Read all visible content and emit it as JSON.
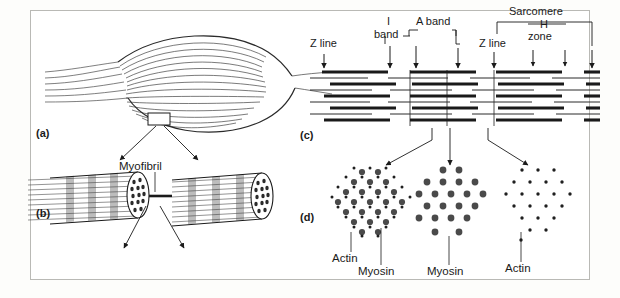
{
  "figure": {
    "background": "#ffffff",
    "border_color": "#b9b9b5",
    "ink_color": "#1a1a1a",
    "band_color": "#9a9a9a"
  },
  "panels": [
    {
      "id": "a",
      "letter": "(a)",
      "name": "whole-muscle",
      "description": "whole muscle belly with tendons"
    },
    {
      "id": "b",
      "letter": "(b)",
      "name": "myofibril",
      "description": "two banded myofibril cylinders"
    },
    {
      "id": "c",
      "letter": "(c)",
      "name": "sarcomere-bands",
      "description": "longitudinal thick and thin filament array"
    },
    {
      "id": "d",
      "letter": "(d)",
      "name": "filament-cross-sections",
      "description": "three transverse sections through filaments"
    }
  ],
  "callouts": {
    "myofibril": "Myofibril"
  },
  "sarcomere_labels": [
    {
      "key": "z_line_left",
      "text": "Z line",
      "x": 321,
      "y": 44,
      "arrow_x": 324,
      "arrow_top": 54,
      "arrow_bottom": 68
    },
    {
      "key": "i_band",
      "text": "I",
      "x": 393,
      "y": 22,
      "arrow_x": 390,
      "arrow_top": 46,
      "arrow_bottom": 68
    },
    {
      "key": "i_band_2",
      "text": "band",
      "x": 383,
      "y": 35,
      "arrow_x": 390,
      "arrow_top": 46,
      "arrow_bottom": 68
    },
    {
      "key": "a_band",
      "text": "A band",
      "x": 423,
      "y": 22,
      "arrow_x": 416,
      "arrow_top": 46,
      "arrow_bottom": 68
    },
    {
      "key": "z_line_right",
      "text": "Z line",
      "x": 492,
      "y": 44,
      "arrow_x": 494,
      "arrow_top": 54,
      "arrow_bottom": 68
    },
    {
      "key": "sarcomere",
      "text": "Sarcomere",
      "x": 515,
      "y": 12,
      "arrow_x": 592,
      "arrow_top": 46,
      "arrow_bottom": 68
    },
    {
      "key": "h_zone",
      "text": "H",
      "x": 545,
      "y": 25,
      "arrow_x": 533,
      "arrow_top": 50,
      "arrow_bottom": 66
    },
    {
      "key": "h_zone_2",
      "text": "zone",
      "x": 535,
      "y": 37,
      "arrow_x": 565,
      "arrow_top": 50,
      "arrow_bottom": 66
    }
  ],
  "cross_sections": [
    {
      "key": "overlap",
      "name": "overlap-region",
      "labels": [
        "Actin",
        "Myosin"
      ]
    },
    {
      "key": "a_band_center",
      "name": "myosin-only-region",
      "labels": [
        "Myosin"
      ]
    },
    {
      "key": "i_band_region",
      "name": "actin-only-region",
      "labels": [
        "Actin"
      ]
    }
  ],
  "cross_section_labels": [
    {
      "key": "actin_left",
      "text": "Actin",
      "x": 341,
      "y": 258,
      "leader_x": 351,
      "leader_top": 232,
      "leader_bottom": 252
    },
    {
      "key": "myosin_left",
      "text": "Myosin",
      "x": 366,
      "y": 271,
      "leader_x": 381,
      "leader_top": 228,
      "leader_bottom": 265
    },
    {
      "key": "myosin_mid",
      "text": "Myosin",
      "x": 434,
      "y": 271,
      "leader_x": 449,
      "leader_top": 236,
      "leader_bottom": 265
    },
    {
      "key": "actin_right",
      "text": "Actin",
      "x": 512,
      "y": 268,
      "leader_x": 521,
      "leader_top": 232,
      "leader_bottom": 262
    }
  ],
  "filament_legend": {
    "thick_filament": "Myosin",
    "thin_filament": "Actin"
  }
}
